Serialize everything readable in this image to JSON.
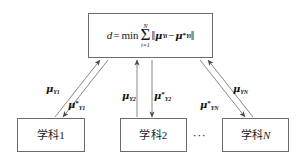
{
  "diagram": {
    "background_color": "#ffffff",
    "line_color": "#6b6b6b",
    "text_color": "#111111",
    "formula_box": {
      "name": "objective-function",
      "expression_plain": "d = min ∑_{i=1}^{N} ||μ_{Y_i} − μ*_{Y_i}||",
      "parts": {
        "lhs": "d",
        "equals": "=",
        "min": "min",
        "sigma_upper": "N",
        "sigma_lower": "i=1",
        "norm_open": "‖",
        "mu": "μ",
        "sub_1": "Y",
        "sub_1_index": "i",
        "minus": "−",
        "star": "*",
        "norm_close": "‖"
      }
    },
    "nodes": [
      {
        "id": "node-1",
        "label_cjk": "学科",
        "label_index": "1",
        "index_italic": false
      },
      {
        "id": "node-2",
        "label_cjk": "学科",
        "label_index": "2",
        "index_italic": false
      },
      {
        "id": "node-n",
        "label_cjk": "学科",
        "label_index": "N",
        "index_italic": true
      }
    ],
    "ellipsis": "···",
    "edge_labels": [
      {
        "id": "mu-y1",
        "mu": "μ",
        "sub": "Y",
        "sub_index": "1",
        "star": "",
        "direction": "up"
      },
      {
        "id": "mu-y1-star",
        "mu": "μ",
        "sub": "Y",
        "sub_index": "1",
        "star": "*",
        "direction": "down"
      },
      {
        "id": "mu-y2",
        "mu": "μ",
        "sub": "Y",
        "sub_index": "2",
        "star": "",
        "direction": "up"
      },
      {
        "id": "mu-y2-star",
        "mu": "μ",
        "sub": "Y",
        "sub_index": "2",
        "star": "*",
        "direction": "down"
      },
      {
        "id": "mu-yn",
        "mu": "μ",
        "sub": "Y",
        "sub_index": "N",
        "star": "",
        "direction": "up"
      },
      {
        "id": "mu-yn-star",
        "mu": "μ",
        "sub": "Y",
        "sub_index": "N",
        "star": "*",
        "direction": "down"
      }
    ]
  }
}
